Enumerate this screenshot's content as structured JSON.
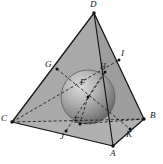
{
  "figure": {
    "type": "geometry-diagram",
    "background_color": "#ffffff",
    "face_fill_color": "#a8a8a8",
    "face_fill_color_dark": "#9a9a9a",
    "edge_color": "#1a1a1a",
    "sphere_light_color": "#d8d8d8",
    "sphere_mid_color": "#9c9c9c",
    "sphere_dark_color": "#6e6e6e",
    "dash_color": "#1f1f1f"
  },
  "vertices": [
    {
      "id": "D",
      "label": "D",
      "x": 94,
      "y": 13,
      "label_x": 90,
      "label_y": 1
    },
    {
      "id": "C",
      "label": "C",
      "x": 12,
      "y": 122,
      "label_x": 1,
      "label_y": 115
    },
    {
      "id": "B",
      "label": "B",
      "x": 144,
      "y": 119,
      "label_x": 150,
      "label_y": 112
    },
    {
      "id": "A",
      "label": "A",
      "x": 113,
      "y": 146,
      "label_x": 111,
      "label_y": 150
    }
  ],
  "points": [
    {
      "id": "G",
      "label": "G",
      "x": 57,
      "y": 69,
      "label_x": 45,
      "label_y": 61
    },
    {
      "id": "I",
      "label": "I",
      "x": 119,
      "y": 60,
      "label_x": 121,
      "label_y": 50
    },
    {
      "id": "H",
      "label": "H",
      "x": 104,
      "y": 73,
      "label_x": 101,
      "label_y": 64
    },
    {
      "id": "F",
      "label": "F",
      "x": 88,
      "y": 86,
      "label_x": 82,
      "label_y": 80
    },
    {
      "id": "E",
      "label": "E",
      "x": 80,
      "y": 123,
      "label_x": 75,
      "label_y": 118
    },
    {
      "id": "J",
      "label": "J",
      "x": 66,
      "y": 131,
      "label_x": 61,
      "label_y": 133
    },
    {
      "id": "K",
      "label": "K",
      "x": 130,
      "y": 129,
      "label_x": 127,
      "label_y": 131
    }
  ],
  "sphere": {
    "center_x": 88,
    "center_y": 97,
    "radius": 27
  },
  "label_font_size_px": 9
}
